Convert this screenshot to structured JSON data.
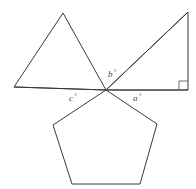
{
  "figure": {
    "background_color": "#ffffff",
    "stroke_color": "#3a3a3a",
    "label_color": "#4a4a4a",
    "mark_color": "#6a6a6a",
    "center_point": {
      "x": 106,
      "y": 90
    }
  },
  "labels": {
    "a": {
      "text": "a",
      "degree": "°",
      "x": 133,
      "y": 101
    },
    "b": {
      "text": "b",
      "degree": "°",
      "x": 108,
      "y": 77
    },
    "c": {
      "text": "c",
      "degree": "°",
      "x": 69,
      "y": 101
    }
  },
  "shapes": {
    "equilateral_triangle": {
      "name": "equilateral-triangle",
      "points": "63,13 14,87 106,90"
    },
    "right_triangle": {
      "name": "right-triangle",
      "points": "106,90 188,12 188,90"
    },
    "pentagon": {
      "name": "regular-pentagon",
      "points": "106,90 157,124 140,184 72,184 53,125"
    }
  },
  "rays": {
    "horizontal_left": {
      "name": "ray-left",
      "x1": 14,
      "y1": 87,
      "x2": 106,
      "y2": 90
    },
    "horizontal_right": {
      "name": "ray-right",
      "x1": 106,
      "y1": 90,
      "x2": 188,
      "y2": 90
    },
    "hypotenuse": {
      "name": "ray-hypotenuse",
      "x1": 106,
      "y1": 90,
      "x2": 188,
      "y2": 12
    }
  },
  "right_angle_mark": {
    "name": "right-angle-mark",
    "points": "179,90 179,81 188,81"
  }
}
